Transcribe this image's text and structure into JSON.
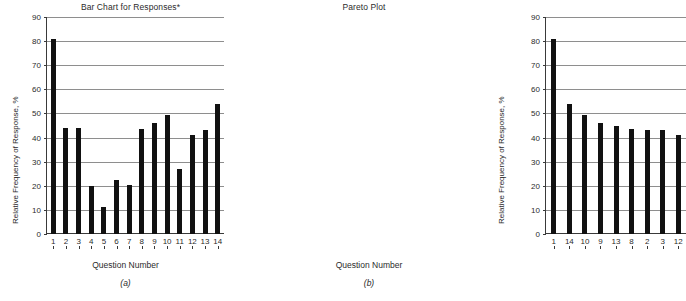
{
  "figure": {
    "xlabel": "Question Number",
    "ylabel": "Relative Frequency of Response, %"
  },
  "panel_a": {
    "letter": "(a)",
    "title": "Bar Chart for Responses*"
  },
  "panel_b": {
    "letter": "(b)",
    "title": "Pareto Plot"
  },
  "chart_data": [
    {
      "type": "bar",
      "title": "Bar Chart for Responses*",
      "xlabel": "Question Number",
      "ylabel": "Relative Frequency of Response, %",
      "categories": [
        "1",
        "2",
        "3",
        "4",
        "5",
        "6",
        "7",
        "8",
        "9",
        "10",
        "11",
        "12",
        "13",
        "14"
      ],
      "values": [
        81,
        44,
        44,
        20,
        11,
        22.5,
        20.5,
        43.5,
        46,
        49.5,
        27,
        41,
        43,
        54
      ],
      "ylim": [
        0,
        90
      ],
      "yticks": [
        0,
        10,
        20,
        30,
        40,
        50,
        60,
        70,
        80,
        90
      ],
      "grid": true,
      "legend": "none",
      "panel": "(a)"
    },
    {
      "type": "bar",
      "title": "Pareto Plot",
      "xlabel": "Question Number",
      "ylabel": "Relative Frequency of Response, %",
      "categories": [
        "1",
        "14",
        "10",
        "9",
        "13",
        "8",
        "2",
        "3",
        "12"
      ],
      "values": [
        81,
        54,
        49.5,
        46,
        45,
        43.5,
        43,
        43,
        41
      ],
      "ylim": [
        0,
        90
      ],
      "yticks": [
        0,
        10,
        20,
        30,
        40,
        50,
        60,
        70,
        80,
        90
      ],
      "grid": true,
      "legend": "none",
      "panel": "(b)"
    }
  ]
}
